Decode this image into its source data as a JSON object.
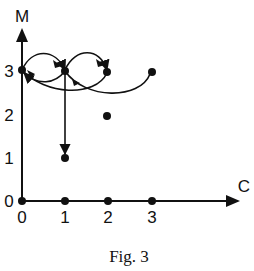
{
  "figure": {
    "caption": "Fig. 3",
    "x_axis_label": "C",
    "y_axis_label": "M",
    "x_ticks": [
      "0",
      "1",
      "2",
      "3"
    ],
    "y_ticks": [
      "0",
      "1",
      "2",
      "3"
    ]
  },
  "diagram": {
    "type": "state-transition graph",
    "points": [
      {
        "c": 0,
        "m": 0
      },
      {
        "c": 1,
        "m": 0
      },
      {
        "c": 2,
        "m": 0
      },
      {
        "c": 3,
        "m": 0
      },
      {
        "c": 1,
        "m": 1
      },
      {
        "c": 2,
        "m": 2
      },
      {
        "c": 0,
        "m": 3
      },
      {
        "c": 1,
        "m": 3
      },
      {
        "c": 2,
        "m": 3
      },
      {
        "c": 3,
        "m": 3
      }
    ],
    "edges": [
      {
        "from": [
          0,
          3
        ],
        "to": [
          1,
          3
        ],
        "style": "arc-above"
      },
      {
        "from": [
          1,
          3
        ],
        "to": [
          0,
          3
        ],
        "style": "arc-below"
      },
      {
        "from": [
          1,
          3
        ],
        "to": [
          2,
          3
        ],
        "style": "arc-above"
      },
      {
        "from": [
          1,
          3
        ],
        "to": [
          3,
          3
        ],
        "style": "arc-below"
      },
      {
        "from": [
          1,
          3
        ],
        "to": [
          1,
          1
        ],
        "style": "straight"
      }
    ]
  }
}
